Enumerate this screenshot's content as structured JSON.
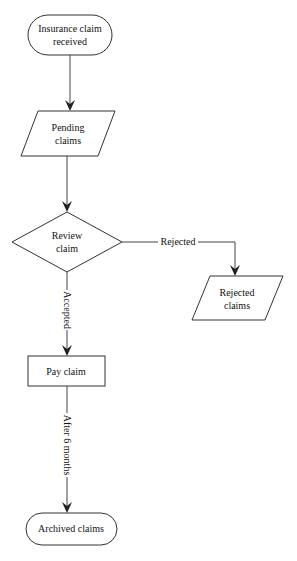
{
  "diagram": {
    "type": "flowchart",
    "nodes": [
      {
        "id": "start",
        "shape": "terminator",
        "lines": [
          "Insurance claim",
          "received"
        ]
      },
      {
        "id": "pending",
        "shape": "parallelogram",
        "lines": [
          "Pending",
          "claims"
        ]
      },
      {
        "id": "review",
        "shape": "decision",
        "lines": [
          "Review",
          "claim"
        ]
      },
      {
        "id": "rejected",
        "shape": "parallelogram",
        "lines": [
          "Rejected",
          "claims"
        ]
      },
      {
        "id": "pay",
        "shape": "process",
        "lines": [
          "Pay claim"
        ]
      },
      {
        "id": "archived",
        "shape": "terminator",
        "lines": [
          "Archived claims"
        ]
      }
    ],
    "edges": [
      {
        "from": "start",
        "to": "pending",
        "label": ""
      },
      {
        "from": "pending",
        "to": "review",
        "label": ""
      },
      {
        "from": "review",
        "to": "rejected",
        "label": "Rejected"
      },
      {
        "from": "review",
        "to": "pay",
        "label": "Accepted"
      },
      {
        "from": "pay",
        "to": "archived",
        "label": "After 6 months"
      }
    ]
  },
  "colors": {
    "background": "#ffffff",
    "stroke": "#333333",
    "text": "#111111"
  }
}
